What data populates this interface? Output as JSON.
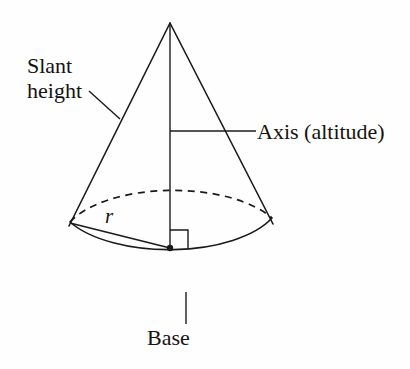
{
  "diagram": {
    "shape": "cone",
    "background_color": "#fefefe",
    "line_color": "#1a1a1a",
    "labels": {
      "slant_height_line1": "Slant",
      "slant_height_line2": "height",
      "axis": "Axis (altitude)",
      "base": "Base",
      "radius": "r"
    },
    "geometry": {
      "apex": [
        170,
        23
      ],
      "base_center": [
        171,
        248
      ],
      "base_semi_major": 112,
      "base_semi_minor": 52,
      "left_tangent": [
        70,
        222
      ],
      "right_tangent": [
        272,
        218
      ],
      "right_angle_marker_size": 18
    }
  }
}
